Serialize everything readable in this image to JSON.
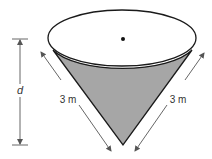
{
  "diagram": {
    "type": "cone",
    "colors": {
      "fill": "#a6a6a6",
      "stroke": "#1a1a1a",
      "dimension": "#555555",
      "background": "#ffffff"
    },
    "labels": {
      "depth": "d",
      "slant_left": "3 m",
      "slant_right": "3 m"
    }
  }
}
